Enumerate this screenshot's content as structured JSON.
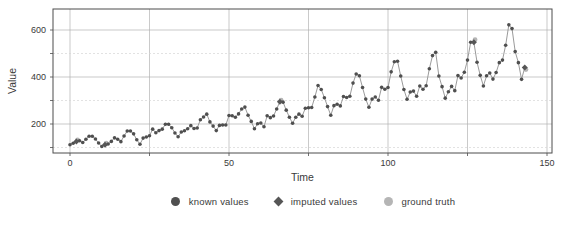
{
  "legend": {
    "items": [
      {
        "name": "known values",
        "marker": "circle"
      },
      {
        "name": "imputed values",
        "marker": "diamond"
      },
      {
        "name": "ground truth",
        "marker": "circle"
      }
    ]
  },
  "chart_data": {
    "type": "scatter",
    "title": "",
    "xlabel": "Time",
    "ylabel": "Value",
    "xlim": [
      -5,
      152
    ],
    "ylim": [
      75,
      690
    ],
    "x_ticks": [
      0,
      50,
      100,
      150
    ],
    "x_gridlines": [
      0,
      25,
      50,
      75,
      100,
      125,
      150
    ],
    "y_ticks": [
      200,
      400,
      600
    ],
    "y_gridlines": [
      100,
      200,
      300,
      400,
      500,
      600
    ],
    "grid": true,
    "legend_position": "bottom-center",
    "colors": {
      "known": "#4f4f4f",
      "imputed": "#565656",
      "ground_truth": "#b5b5b5",
      "line": "#8f8f8f",
      "grid_major": "#b3b3b3",
      "grid_minor": "#d6d6d6",
      "border": "#4d4d4d",
      "text": "#3a3a3a"
    },
    "x": [
      0,
      1,
      2,
      3,
      4,
      5,
      6,
      7,
      8,
      9,
      10,
      11,
      12,
      13,
      14,
      15,
      16,
      17,
      18,
      19,
      20,
      21,
      22,
      23,
      24,
      25,
      26,
      27,
      28,
      29,
      30,
      31,
      32,
      33,
      34,
      35,
      36,
      37,
      38,
      39,
      40,
      41,
      42,
      43,
      44,
      45,
      46,
      47,
      48,
      49,
      50,
      51,
      52,
      53,
      54,
      55,
      56,
      57,
      58,
      59,
      60,
      61,
      62,
      63,
      64,
      65,
      66,
      67,
      68,
      69,
      70,
      71,
      72,
      73,
      74,
      75,
      76,
      77,
      78,
      79,
      80,
      81,
      82,
      83,
      84,
      85,
      86,
      87,
      88,
      89,
      90,
      91,
      92,
      93,
      94,
      95,
      96,
      97,
      98,
      99,
      100,
      101,
      102,
      103,
      104,
      105,
      106,
      107,
      108,
      109,
      110,
      111,
      112,
      113,
      114,
      115,
      116,
      117,
      118,
      119,
      120,
      121,
      122,
      123,
      124,
      125,
      126,
      127,
      128,
      129,
      130,
      131,
      132,
      133,
      134,
      135,
      136,
      137,
      138,
      139,
      140,
      141,
      142,
      143
    ],
    "ground_truth_values": [
      112,
      118,
      132,
      129,
      121,
      135,
      148,
      148,
      136,
      119,
      104,
      118,
      115,
      126,
      141,
      135,
      125,
      149,
      170,
      170,
      158,
      133,
      114,
      140,
      145,
      150,
      178,
      163,
      172,
      178,
      199,
      199,
      184,
      162,
      146,
      166,
      171,
      180,
      193,
      181,
      183,
      218,
      230,
      242,
      209,
      191,
      172,
      194,
      196,
      196,
      236,
      235,
      229,
      243,
      264,
      272,
      237,
      211,
      180,
      201,
      204,
      188,
      235,
      227,
      234,
      264,
      302,
      293,
      259,
      229,
      203,
      229,
      242,
      233,
      267,
      269,
      270,
      315,
      364,
      347,
      312,
      274,
      237,
      278,
      284,
      277,
      317,
      313,
      318,
      374,
      413,
      405,
      355,
      306,
      271,
      306,
      315,
      301,
      356,
      348,
      355,
      422,
      465,
      467,
      404,
      347,
      305,
      336,
      340,
      318,
      362,
      348,
      363,
      435,
      491,
      505,
      404,
      359,
      310,
      337,
      360,
      342,
      406,
      396,
      420,
      472,
      548,
      559,
      463,
      407,
      362,
      405,
      417,
      391,
      419,
      461,
      472,
      535,
      622,
      606,
      508,
      461,
      390,
      432
    ],
    "imputed_indices": [
      2,
      11,
      66,
      127,
      143
    ],
    "imputed_values": [
      126,
      112,
      295,
      548,
      440
    ]
  }
}
